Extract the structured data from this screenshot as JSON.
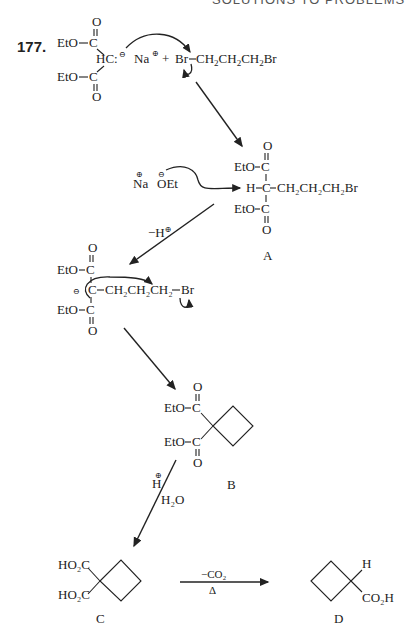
{
  "header": {
    "running_title": "SOLUTIONS TO PROBLEMS"
  },
  "problem": {
    "number": "177."
  },
  "step1": {
    "ester_top": "EtO",
    "ester_bottom": "EtO",
    "carbonyl_O": "O",
    "carbon": "C",
    "carbanion": "HC:",
    "charge_minus": "⊖",
    "counterion": "Na",
    "charge_plus": "⊕",
    "plus_sign": "+",
    "reagent_Br1": "Br",
    "reagent_chain": [
      "CH",
      "2",
      "CH",
      "2",
      "CH",
      "2",
      "Br"
    ]
  },
  "step2": {
    "base_cation": "Na",
    "base_anion": "OEt",
    "charge_plus": "⊕",
    "charge_minus": "⊖",
    "H": "H",
    "chain_text": "CH₂CH₂CH₂Br",
    "label": "A"
  },
  "step3": {
    "arrow_label": "−H",
    "arrow_label_charge": "⊕",
    "chain_text": "CH₂CH₂CH₂",
    "Br": "Br"
  },
  "step4": {
    "label": "B"
  },
  "step5": {
    "reagent_H": "H",
    "reagent_charge": "⊕",
    "reagent_water": "H₂O"
  },
  "step6": {
    "acid_group": "HO₂C",
    "label_C": "C",
    "arrow_top": "−CO₂",
    "arrow_bottom": "Δ",
    "H": "H",
    "acid_group_D": "CO₂H",
    "label_D": "D"
  }
}
